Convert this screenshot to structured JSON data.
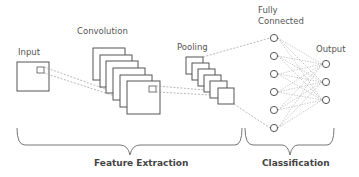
{
  "diagram": {
    "colors": {
      "stroke": "#555555",
      "dashed": "#999999",
      "brace": "#777777",
      "text": "#555555"
    },
    "labels": {
      "input": "Input",
      "convolution": "Convolution",
      "pooling": "Pooling",
      "fully_connected_line1": "Fully",
      "fully_connected_line2": "Connected",
      "output": "Output"
    },
    "groups": {
      "feature_extraction": "Feature Extraction",
      "classification": "Classification"
    },
    "layers": {
      "convolution_maps": 6,
      "pooling_maps": 6,
      "fully_connected_nodes": 6,
      "output_nodes": 3
    }
  }
}
